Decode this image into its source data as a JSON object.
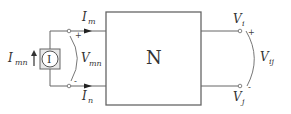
{
  "network": {
    "label": "N"
  },
  "source": {
    "symbol": "I",
    "current_label": "I",
    "current_sub": "mn"
  },
  "left_port": {
    "top_current": {
      "label": "I",
      "sub": "m"
    },
    "bottom_current": {
      "label": "I",
      "sub": "n"
    },
    "voltage": {
      "label": "V",
      "sub": "mn"
    },
    "plus": "+",
    "minus": "-"
  },
  "right_port": {
    "top_node": {
      "label": "V",
      "sub": "i"
    },
    "bottom_node": {
      "label": "V",
      "sub": "j"
    },
    "voltage": {
      "label": "V",
      "sub": "ij"
    },
    "plus": "+",
    "minus": "-"
  },
  "colors": {
    "line": "#555555",
    "box": "#666666",
    "text": "#333333"
  }
}
